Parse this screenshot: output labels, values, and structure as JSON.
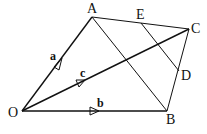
{
  "diagram": {
    "type": "vector-geometry",
    "points": {
      "O": {
        "label": "O",
        "x": 22,
        "y": 111
      },
      "A": {
        "label": "A",
        "x": 92,
        "y": 17
      },
      "C": {
        "label": "C",
        "x": 189,
        "y": 29
      },
      "B": {
        "label": "B",
        "x": 167,
        "y": 111
      },
      "E": {
        "label": "E",
        "x": 141,
        "y": 23
      },
      "D": {
        "label": "D",
        "x": 179,
        "y": 71
      }
    },
    "vectors": {
      "a": {
        "label": "a",
        "from": "O",
        "to": "A"
      },
      "b": {
        "label": "b",
        "from": "O",
        "to": "B"
      },
      "c": {
        "label": "c",
        "from": "O",
        "to": "C"
      }
    },
    "segments": [
      [
        "A",
        "C"
      ],
      [
        "C",
        "B"
      ],
      [
        "A",
        "B"
      ],
      [
        "E",
        "D"
      ]
    ],
    "line_color": "#111111"
  }
}
